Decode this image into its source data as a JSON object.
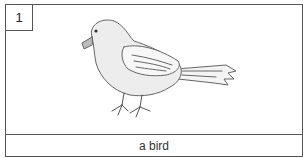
{
  "card": {
    "number": "1",
    "image_subject": "bird-illustration",
    "caption": "a bird"
  }
}
